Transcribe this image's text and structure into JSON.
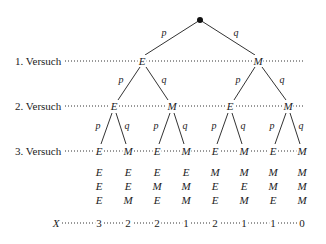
{
  "diagram": {
    "type": "probability-tree",
    "levels": [
      "1. Versuch",
      "2. Versuch",
      "3. Versuch"
    ],
    "branch_labels": {
      "left": "p",
      "right": "q"
    },
    "level1": [
      "E",
      "M"
    ],
    "level2": [
      "E",
      "M",
      "E",
      "M"
    ],
    "level3": [
      "E",
      "M",
      "E",
      "M",
      "E",
      "M",
      "E",
      "M"
    ],
    "outcomes": [
      [
        "E",
        "E",
        "E"
      ],
      [
        "E",
        "E",
        "M"
      ],
      [
        "E",
        "M",
        "E"
      ],
      [
        "E",
        "M",
        "M"
      ],
      [
        "M",
        "E",
        "E"
      ],
      [
        "M",
        "E",
        "M"
      ],
      [
        "M",
        "M",
        "E"
      ],
      [
        "M",
        "M",
        "M"
      ]
    ],
    "x_label": "X",
    "x_values": [
      "3",
      "2",
      "2",
      "1",
      "2",
      "1",
      "1",
      "0"
    ]
  }
}
